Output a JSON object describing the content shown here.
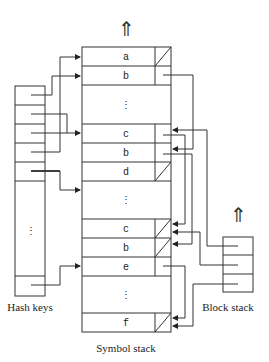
{
  "diagram": {
    "labels": {
      "hash_keys": "Hash keys",
      "symbol_stack": "Symbol stack",
      "block_stack": "Block stack"
    },
    "symbol_stack": {
      "entries": [
        "a",
        "b",
        "⋮",
        "c",
        "b",
        "d",
        "⋮",
        "c",
        "b",
        "e",
        "⋮",
        "f"
      ]
    },
    "growth_arrow": "⇑",
    "ellipsis": "⋮"
  }
}
